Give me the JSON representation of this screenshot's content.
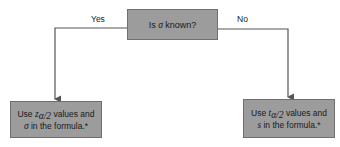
{
  "diagram": {
    "decision": {
      "prefix": "Is ",
      "symbol": "σ",
      "suffix": " known?"
    },
    "branches": {
      "yes": {
        "label": "Yes",
        "text_line1_prefix": "Use ",
        "text_line1_symbol": "z",
        "text_line1_subscript": "α/2",
        "text_line1_suffix": " values and",
        "text_line2_symbol": "σ",
        "text_line2_suffix": " in the formula.*"
      },
      "no": {
        "label": "No",
        "text_line1_prefix": "Use ",
        "text_line1_symbol": "t",
        "text_line1_subscript": "α/2",
        "text_line1_suffix": " values and",
        "text_line2_symbol": "s",
        "text_line2_suffix": " in the formula.*"
      }
    },
    "colors": {
      "box_fill": "#9c9c9c",
      "box_border": "#6f6f6f",
      "line": "#555555"
    }
  }
}
